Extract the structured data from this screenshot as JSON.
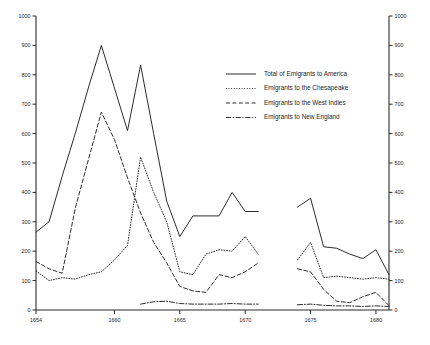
{
  "chart_data": {
    "type": "line",
    "title": "",
    "xlabel": "",
    "ylabel": "",
    "xlim": [
      1654,
      1681
    ],
    "ylim": [
      0,
      1000
    ],
    "ytick_step": 100,
    "grid": false,
    "dual_y_axis": true,
    "legend_position": "upper-right-inside",
    "xticks": [
      1654,
      1660,
      1665,
      1670,
      1675,
      1680
    ],
    "xtick_labels": [
      "1654",
      "1660",
      "1665",
      "1670",
      "1675",
      "1680"
    ],
    "yticks": [
      0,
      100,
      200,
      300,
      400,
      500,
      600,
      700,
      800,
      900,
      1000
    ],
    "ytick_labels": [
      "0",
      "100",
      "200",
      "300",
      "400",
      "500",
      "600",
      "700",
      "800",
      "900",
      "1000"
    ],
    "yticks_right": [
      0,
      100,
      200,
      300,
      400,
      500,
      600,
      700,
      800,
      900,
      1000
    ],
    "ytick_labels_right": [
      "0",
      "100",
      "200",
      "300",
      "400",
      "500",
      "600",
      "700",
      "800",
      "900",
      "1000"
    ],
    "data_gap_years": [
      1672,
      1673
    ],
    "series": [
      {
        "name": "Total of Emigrants to America",
        "style": "solid",
        "x": [
          1654,
          1655,
          1656,
          1657,
          1658,
          1659,
          1660,
          1661,
          1662,
          1663,
          1664,
          1665,
          1666,
          1667,
          1668,
          1669,
          1670,
          1671,
          1674,
          1675,
          1676,
          1677,
          1678,
          1679,
          1680,
          1681
        ],
        "values": [
          265,
          300,
          455,
          600,
          755,
          900,
          755,
          610,
          833,
          600,
          370,
          250,
          320,
          320,
          320,
          400,
          335,
          335,
          350,
          380,
          215,
          210,
          190,
          175,
          205,
          120
        ]
      },
      {
        "name": "Emigrants to the Chesapeake",
        "style": "dotted",
        "x": [
          1654,
          1655,
          1656,
          1657,
          1658,
          1659,
          1660,
          1661,
          1662,
          1663,
          1664,
          1665,
          1666,
          1667,
          1668,
          1669,
          1670,
          1671,
          1674,
          1675,
          1676,
          1677,
          1678,
          1679,
          1680,
          1681
        ],
        "values": [
          133,
          100,
          110,
          105,
          120,
          130,
          170,
          220,
          520,
          400,
          300,
          130,
          120,
          190,
          205,
          200,
          250,
          190,
          170,
          230,
          110,
          115,
          110,
          105,
          110,
          105
        ]
      },
      {
        "name": "Emigrants to the West Indies",
        "style": "dashed",
        "x": [
          1654,
          1655,
          1656,
          1657,
          1658,
          1659,
          1660,
          1661,
          1662,
          1663,
          1664,
          1665,
          1666,
          1667,
          1668,
          1669,
          1670,
          1671,
          1674,
          1675,
          1676,
          1677,
          1678,
          1679,
          1680,
          1681
        ],
        "values": [
          165,
          140,
          125,
          345,
          510,
          673,
          580,
          450,
          330,
          230,
          160,
          80,
          65,
          60,
          120,
          110,
          130,
          160,
          140,
          130,
          70,
          30,
          25,
          45,
          60,
          15
        ]
      },
      {
        "name": "Emigrants to New England",
        "style": "dashdot",
        "x": [
          1662,
          1663,
          1664,
          1665,
          1666,
          1667,
          1668,
          1669,
          1670,
          1671,
          1674,
          1675,
          1676,
          1677,
          1678,
          1679,
          1680,
          1681
        ],
        "values": [
          20,
          28,
          30,
          22,
          20,
          20,
          20,
          22,
          20,
          20,
          18,
          20,
          16,
          14,
          14,
          12,
          14,
          12
        ]
      }
    ]
  },
  "legend": {
    "items": [
      {
        "label": "Total of Emigrants to America",
        "style": "solid"
      },
      {
        "label": "Emigrants to the Chesapeake",
        "style": "dotted"
      },
      {
        "label": "Emigrants to the West Indies",
        "style": "dashed"
      },
      {
        "label": "Emigrants to New England",
        "style": "dashdot"
      }
    ]
  }
}
